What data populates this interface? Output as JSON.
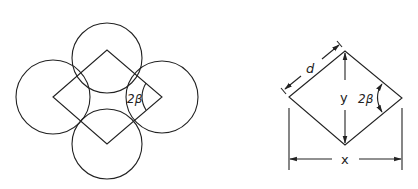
{
  "figure": {
    "left_panel": {
      "description": "Four circles arranged around a rhombus, each circle centered at a rhombus vertex",
      "circles": [
        {
          "name": "top",
          "cx": 107,
          "cy": 58,
          "r": 36
        },
        {
          "name": "left",
          "cx": 53,
          "cy": 97,
          "r": 36
        },
        {
          "name": "right",
          "cx": 162,
          "cy": 97,
          "r": 36
        },
        {
          "name": "bottom",
          "cx": 107,
          "cy": 143,
          "r": 36
        }
      ],
      "rhombus": {
        "left": [
          53,
          97
        ],
        "top": [
          107,
          50
        ],
        "right": [
          162,
          97
        ],
        "bottom": [
          107,
          144
        ]
      },
      "angle_label": "2β"
    },
    "right_panel": {
      "description": "Rhombus with dimension annotations",
      "side_label": "d",
      "diagonal_vertical_label": "y",
      "diagonal_horizontal_label": "x",
      "angle_label": "2β"
    }
  }
}
